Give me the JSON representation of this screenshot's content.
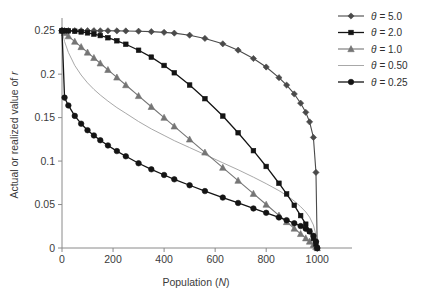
{
  "chart_data": {
    "type": "line",
    "title": "",
    "xlabel": "Population (N)",
    "xlabel_plain": "Population",
    "xlabel_italic": "N",
    "ylabel": "Actual or realized value of r",
    "ylabel_plain": "Actual or realized value of",
    "ylabel_italic": "r",
    "xlim": [
      0,
      1050
    ],
    "ylim": [
      0,
      0.26
    ],
    "xticks": [
      0,
      200,
      400,
      600,
      800,
      1000
    ],
    "xtick_labels": [
      "0",
      "200",
      "400",
      "600",
      "800",
      "1000"
    ],
    "yticks": [
      0,
      0.05,
      0.1,
      0.15,
      0.2,
      0.25
    ],
    "ytick_labels": [
      "0",
      "0.05",
      "0.1",
      "0.15",
      "0.2",
      "0.25"
    ],
    "grid": false,
    "legend_position": "top-right",
    "x": [
      0,
      10,
      25,
      50,
      75,
      100,
      125,
      150,
      180,
      215,
      250,
      300,
      350,
      400,
      440,
      500,
      560,
      630,
      690,
      750,
      800,
      850,
      880,
      910,
      935,
      955,
      970,
      985,
      995,
      1000
    ],
    "series": [
      {
        "name": "θ = 5.0",
        "label_theta": "θ",
        "label_value": "= 5.0",
        "theta": 5.0,
        "color": "#4a4a4a",
        "marker": "diamond",
        "marker_size": 4.2,
        "line_width": 1.1,
        "values": [
          0.25,
          0.25,
          0.25,
          0.25,
          0.25,
          0.25,
          0.25,
          0.2499,
          0.2499,
          0.2498,
          0.2497,
          0.2494,
          0.2489,
          0.2481,
          0.2472,
          0.2448,
          0.2411,
          0.2349,
          0.2276,
          0.218,
          0.2082,
          0.196,
          0.1874,
          0.1772,
          0.1666,
          0.1561,
          0.1451,
          0.1272,
          0.087,
          0.0
        ]
      },
      {
        "name": "θ = 2.0",
        "label_theta": "θ",
        "label_value": "= 2.0",
        "theta": 2.0,
        "color": "#141414",
        "marker": "square",
        "marker_size": 4.6,
        "line_width": 1.3,
        "values": [
          0.25,
          0.25,
          0.2498,
          0.2494,
          0.2486,
          0.2475,
          0.2461,
          0.2444,
          0.2419,
          0.2384,
          0.2344,
          0.2275,
          0.2196,
          0.21,
          0.2016,
          0.1875,
          0.1718,
          0.1518,
          0.1326,
          0.112,
          0.0938,
          0.0745,
          0.0622,
          0.0491,
          0.0373,
          0.0274,
          0.0194,
          0.0109,
          0.0048,
          0.0
        ]
      },
      {
        "name": "θ = 1.0",
        "label_theta": "θ",
        "label_value": "= 1.0",
        "theta": 1.0,
        "color": "#757575",
        "marker": "triangle",
        "marker_size": 4.4,
        "line_width": 1.1,
        "values": [
          0.25,
          0.2475,
          0.2438,
          0.2375,
          0.2313,
          0.225,
          0.2188,
          0.2125,
          0.205,
          0.1963,
          0.1875,
          0.175,
          0.1625,
          0.15,
          0.14,
          0.125,
          0.11,
          0.0925,
          0.0775,
          0.0625,
          0.05,
          0.0375,
          0.03,
          0.0225,
          0.0163,
          0.0113,
          0.0075,
          0.0038,
          0.0013,
          0.0
        ]
      },
      {
        "name": "θ = 0.50",
        "label_theta": "θ",
        "label_value": "= 0.50",
        "theta": 0.5,
        "color": "#9e9e9e",
        "marker": "none",
        "marker_size": 0,
        "line_width": 0.9,
        "values": [
          0.25,
          0.2375,
          0.225,
          0.21,
          0.199,
          0.19,
          0.1825,
          0.176,
          0.169,
          0.1615,
          0.155,
          0.1455,
          0.137,
          0.1295,
          0.1235,
          0.1155,
          0.1075,
          0.098,
          0.09,
          0.0815,
          0.074,
          0.066,
          0.0605,
          0.054,
          0.0475,
          0.0415,
          0.0355,
          0.0265,
          0.015,
          0.0
        ]
      },
      {
        "name": "θ = 0.25",
        "label_theta": "θ",
        "label_value": "= 0.25",
        "theta": 0.25,
        "color": "#141414",
        "marker": "circle",
        "marker_size": 4.3,
        "line_width": 1.3,
        "values": [
          0.25,
          0.173,
          0.164,
          0.152,
          0.143,
          0.1355,
          0.1295,
          0.124,
          0.118,
          0.1115,
          0.1055,
          0.0975,
          0.0905,
          0.084,
          0.079,
          0.0722,
          0.0655,
          0.058,
          0.0518,
          0.0455,
          0.0405,
          0.0352,
          0.032,
          0.0285,
          0.0252,
          0.0222,
          0.019,
          0.014,
          0.0075,
          0.0
        ]
      }
    ]
  },
  "colors": {
    "axis": "#8a8a8a",
    "text": "#3b3b3b",
    "background": "#ffffff"
  }
}
